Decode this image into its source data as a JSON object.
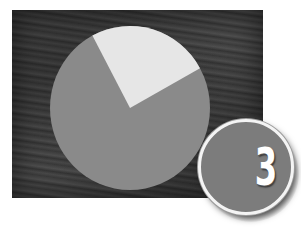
{
  "badge": {
    "number": "3",
    "fill_color": "#7c7c7c",
    "ring_color": "#f4f4f4",
    "text_color": "#ffffff"
  },
  "background": {
    "description": "textured dark wood/stone surface",
    "color": "#404040"
  },
  "chart_data": {
    "type": "pie",
    "title": "",
    "categories": [
      "Light slice",
      "Remainder"
    ],
    "values": [
      25,
      75
    ],
    "colors": [
      "#e6e6e6",
      "#8a8a8a"
    ],
    "slice_start_angle_deg": 29,
    "slice_end_angle_deg": 118,
    "labels_shown": false,
    "legend": "none"
  }
}
